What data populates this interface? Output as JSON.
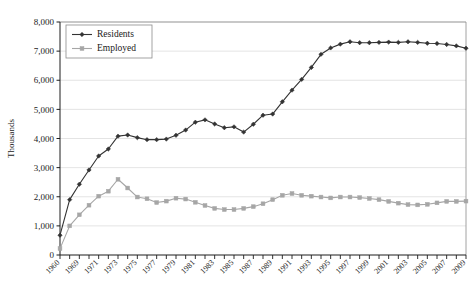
{
  "chart_data": {
    "type": "line",
    "title": "",
    "xlabel": "",
    "ylabel": "Thousands",
    "ylim": [
      0,
      8000
    ],
    "ytick_labels": [
      "0",
      "1,000",
      "2,000",
      "3,000",
      "4,000",
      "5,000",
      "6,000",
      "7,000",
      "8,000"
    ],
    "ytick_values": [
      0,
      1000,
      2000,
      3000,
      4000,
      5000,
      6000,
      7000,
      8000
    ],
    "grid": true,
    "legend_position": "top-left",
    "x": [
      1960,
      1968,
      1969,
      1970,
      1971,
      1972,
      1973,
      1974,
      1975,
      1976,
      1977,
      1978,
      1979,
      1980,
      1981,
      1982,
      1983,
      1984,
      1985,
      1986,
      1987,
      1988,
      1989,
      1990,
      1991,
      1992,
      1993,
      1994,
      1995,
      1996,
      1997,
      1998,
      1999,
      2000,
      2001,
      2002,
      2003,
      2004,
      2005,
      2006,
      2007,
      2008,
      2009
    ],
    "xtick_labels": [
      "1960",
      "",
      "1969",
      "",
      "1971",
      "",
      "1973",
      "",
      "1975",
      "",
      "1977",
      "",
      "1979",
      "",
      "1981",
      "",
      "1983",
      "",
      "1985",
      "",
      "1987",
      "",
      "1989",
      "",
      "1991",
      "",
      "1993",
      "",
      "1995",
      "",
      "1997",
      "",
      "1999",
      "",
      "2001",
      "",
      "2003",
      "",
      "2005",
      "",
      "2007",
      "",
      "2009"
    ],
    "series": [
      {
        "name": "Residents",
        "color": "#333333",
        "marker": "diamond",
        "values": [
          680,
          1900,
          2430,
          2920,
          3400,
          3640,
          4080,
          4120,
          4030,
          3960,
          3960,
          3980,
          4110,
          4290,
          4560,
          4640,
          4500,
          4370,
          4400,
          4220,
          4490,
          4800,
          4840,
          5260,
          5660,
          6030,
          6440,
          6890,
          7110,
          7240,
          7320,
          7290,
          7290,
          7300,
          7310,
          7300,
          7320,
          7300,
          7270,
          7260,
          7230,
          7180,
          7100
        ]
      },
      {
        "name": "Employed",
        "color": "#a6a6a6",
        "marker": "square",
        "values": [
          220,
          1000,
          1380,
          1710,
          2020,
          2190,
          2600,
          2300,
          1990,
          1930,
          1800,
          1850,
          1950,
          1920,
          1810,
          1700,
          1600,
          1560,
          1560,
          1600,
          1660,
          1760,
          1900,
          2050,
          2110,
          2050,
          2020,
          1990,
          1960,
          1990,
          1990,
          1970,
          1940,
          1900,
          1840,
          1780,
          1730,
          1720,
          1740,
          1790,
          1840,
          1840,
          1850
        ]
      }
    ]
  },
  "legend": {
    "items": [
      {
        "label": "Residents"
      },
      {
        "label": "Employed"
      }
    ]
  },
  "axes": {
    "y_title": "Thousands"
  }
}
